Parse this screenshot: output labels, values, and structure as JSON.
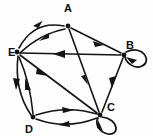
{
  "figure": {
    "kind": "directed-graph-diagram",
    "background_color": "#fdfdfd",
    "ink_color": "#141414",
    "width": 153,
    "height": 136
  },
  "vertices": [
    {
      "id": "A",
      "label": "A",
      "x": 68,
      "y": 26,
      "label_x": 68,
      "label_y": 12
    },
    {
      "id": "B",
      "label": "B",
      "x": 124,
      "y": 55,
      "label_x": 126,
      "label_y": 48
    },
    {
      "id": "C",
      "label": "C",
      "x": 100,
      "y": 115,
      "label_x": 108,
      "label_y": 110
    },
    {
      "id": "D",
      "label": "D",
      "x": 33,
      "y": 117,
      "label_x": 29,
      "label_y": 132
    },
    {
      "id": "E",
      "label": "E",
      "x": 17,
      "y": 52,
      "label_x": 7,
      "label_y": 56
    }
  ],
  "edges": [
    {
      "id": "E-A-upper",
      "from": "E",
      "to": "A",
      "style": "curved",
      "direction": "E to A"
    },
    {
      "id": "A-E-lower",
      "from": "A",
      "to": "E",
      "style": "curved",
      "direction": "A to E"
    },
    {
      "id": "A-B",
      "from": "A",
      "to": "B",
      "style": "straight",
      "direction": "A to B"
    },
    {
      "id": "A-C",
      "from": "A",
      "to": "C",
      "style": "straight",
      "direction": "A to C"
    },
    {
      "id": "B-E",
      "from": "B",
      "to": "E",
      "style": "straight",
      "direction": "B to E"
    },
    {
      "id": "B-C",
      "from": "B",
      "to": "C",
      "style": "straight",
      "direction": "B to C"
    },
    {
      "id": "E-C",
      "from": "E",
      "to": "C",
      "style": "straight",
      "direction": "E to C"
    },
    {
      "id": "E-D-outer",
      "from": "E",
      "to": "D",
      "style": "curved",
      "direction": "E to D"
    },
    {
      "id": "D-E-inner",
      "from": "D",
      "to": "E",
      "style": "curved",
      "direction": "D to E"
    },
    {
      "id": "D-C-upper",
      "from": "D",
      "to": "C",
      "style": "curved",
      "direction": "D to C"
    },
    {
      "id": "C-D-lower",
      "from": "C",
      "to": "D",
      "style": "curved",
      "direction": "C to D"
    }
  ],
  "self_loops": [
    {
      "id": "B-loop",
      "at": "B",
      "position": "right",
      "direction": "B to B"
    },
    {
      "id": "C-loop",
      "at": "C",
      "position": "below",
      "direction": "C to C"
    }
  ]
}
